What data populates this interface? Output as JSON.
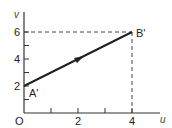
{
  "diagram": {
    "axes": {
      "x_label": "u",
      "y_label": "v",
      "origin_label": "O",
      "x_ticks": [
        "2",
        "4"
      ],
      "y_ticks": [
        "2",
        "4",
        "6"
      ]
    },
    "points": {
      "start": {
        "label": "A'",
        "u": 0,
        "v": 2
      },
      "end": {
        "label": "B'",
        "u": 4,
        "v": 6
      }
    },
    "colors": {
      "line": "#222222",
      "dashed": "#444444"
    }
  }
}
